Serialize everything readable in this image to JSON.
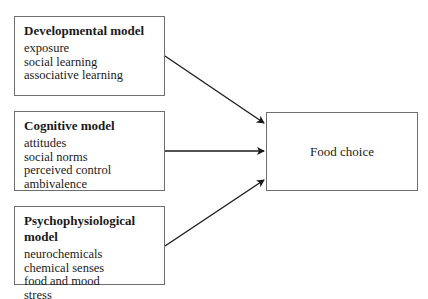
{
  "models": [
    {
      "title": "Developmental model",
      "items": [
        "exposure",
        "social learning",
        "associative learning"
      ]
    },
    {
      "title": "Cognitive model",
      "items": [
        "attitudes",
        "social norms",
        "perceived control",
        "ambivalence"
      ]
    },
    {
      "title": "Psychophysiological model",
      "items": [
        "neurochemicals",
        "chemical senses",
        "food and mood",
        "stress"
      ]
    }
  ],
  "outcome": {
    "label": "Food choice"
  },
  "colors": {
    "line": "#1a1a1a",
    "box_border": "#6e6e6e"
  }
}
